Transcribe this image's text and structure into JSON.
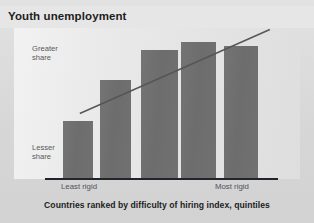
{
  "figure": {
    "title": "Youth unemployment",
    "caption": "Countries ranked by difficulty of hiring index, quintiles",
    "y_axis": {
      "top_label": "Greater\nshare",
      "bottom_label": "Lesser\nshare"
    },
    "x_axis": {
      "left_tick": "Least rigid",
      "right_tick": "Most rigid"
    },
    "colors": {
      "bar": "#6e6e6e",
      "title_band": "#e6e6e6",
      "plot_background": "#ebebeb",
      "page_background": "#d9d9d9",
      "axis": "#23232a",
      "trendline": "#55555c",
      "label_text": "#58585a"
    }
  },
  "chart_data": {
    "type": "bar",
    "title": "Youth unemployment",
    "subtitle": "",
    "xlabel": "Countries ranked by difficulty of hiring index, quintiles",
    "ylabel": "Share of youth unemployment",
    "categories": [
      "1",
      "2",
      "3",
      "4",
      "5"
    ],
    "category_labels": [
      "Least rigid",
      "",
      "",
      "",
      "Most rigid"
    ],
    "values": [
      38,
      66,
      86,
      92,
      88
    ],
    "ylim": [
      0,
      100
    ],
    "ytick_labels": [
      "Lesser share",
      "Greater share"
    ],
    "grid": false,
    "legend": false,
    "annotations": [
      {
        "type": "trendline",
        "label": "rising trend",
        "x_start": 0.55,
        "y_start": 43,
        "x_end": 4.45,
        "y_end": 99
      }
    ],
    "bars_px": [
      {
        "x": 63,
        "width": 30,
        "top": 121
      },
      {
        "x": 100,
        "width": 31,
        "top": 80
      },
      {
        "x": 141,
        "width": 37,
        "top": 50
      },
      {
        "x": 181,
        "width": 35,
        "top": 42
      },
      {
        "x": 224,
        "width": 34,
        "top": 46
      }
    ],
    "baseline_px": 178
  }
}
